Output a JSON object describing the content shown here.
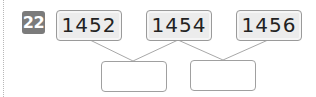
{
  "problem": {
    "number": "22",
    "numbers": [
      "1452",
      "1454",
      "1456"
    ],
    "answers": [
      "",
      ""
    ]
  },
  "colors": {
    "badge": "#7b7b7b",
    "box_fill": "#ececec",
    "box_border": "#9a9a9a",
    "line": "#a8a8a8"
  }
}
